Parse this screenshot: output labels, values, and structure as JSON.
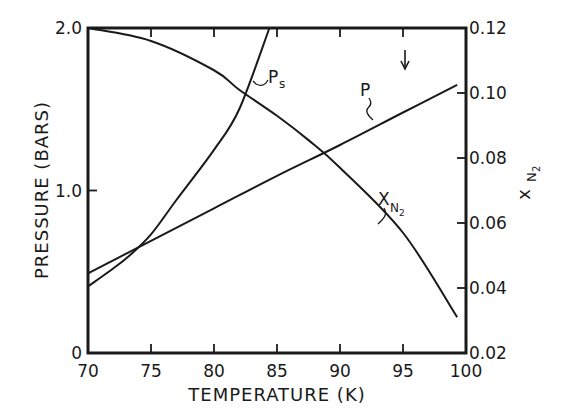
{
  "chart_data": {
    "type": "line",
    "title": "",
    "xlabel": "TEMPERATURE (K)",
    "ylabel": "PRESSURE (BARS)",
    "y2label": "x_N2",
    "xlim": [
      70,
      100
    ],
    "ylim": [
      0,
      2.0
    ],
    "y2lim": [
      0.02,
      0.12
    ],
    "grid": false,
    "legend": "inline curve labels",
    "x_ticks": [
      "70",
      "75",
      "80",
      "85",
      "90",
      "95",
      "100"
    ],
    "y_ticks": [
      "0",
      "1.0",
      "2.0"
    ],
    "y2_ticks": [
      "0.02",
      "0.04",
      "0.06",
      "0.08",
      "0.10",
      "0.12"
    ],
    "series": [
      {
        "name": "P",
        "label": "P",
        "axis": "left",
        "x": [
          70,
          75,
          80,
          85,
          90,
          95,
          99.3
        ],
        "values": [
          0.49,
          0.69,
          0.89,
          1.09,
          1.28,
          1.48,
          1.65
        ]
      },
      {
        "name": "Ps",
        "label": "P",
        "label_sub": "s",
        "axis": "left",
        "x": [
          70,
          72,
          73.3,
          75,
          77,
          80,
          82,
          84.4
        ],
        "values": [
          0.41,
          0.52,
          0.6,
          0.73,
          0.94,
          1.25,
          1.5,
          2.0
        ]
      },
      {
        "name": "xN2",
        "label": "X",
        "label_sub": "N2",
        "axis": "right",
        "x": [
          70,
          75,
          80,
          82,
          85,
          87.5,
          90,
          95,
          99.3
        ],
        "values": [
          0.12,
          0.116,
          0.107,
          0.101,
          0.093,
          0.0855,
          0.077,
          0.057,
          0.031
        ]
      }
    ],
    "annotations": [
      {
        "type": "arrow-down",
        "x": 95.5,
        "description": "downward arrow near top at ~95.5 K"
      }
    ]
  },
  "labels": {
    "xlabel": "TEMPERATURE (K)",
    "ylabel": "PRESSURE (BARS)",
    "y2label_main": "x",
    "y2label_sub": "N",
    "y2label_sub2": "2",
    "p_label": "P",
    "ps_label": "P",
    "ps_sub": "s",
    "x_label": "X",
    "x_sub": "N",
    "x_sub2": "2"
  }
}
